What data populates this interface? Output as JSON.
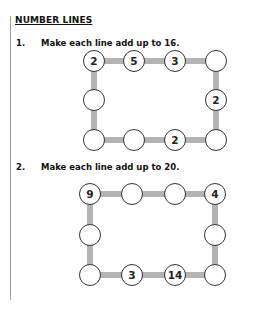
{
  "heading": "NUMBER LINES",
  "questions": [
    {
      "number": "1.",
      "text": "Make each line add up to 16.",
      "circles": {
        "top": [
          "2",
          "5",
          "3",
          ""
        ],
        "left_middle": "",
        "right_middle": "2",
        "bottom": [
          "",
          "",
          "2",
          ""
        ]
      }
    },
    {
      "number": "2.",
      "text": "Make each line add up to 20.",
      "circles": {
        "top": [
          "9",
          "",
          "",
          "4"
        ],
        "left_middle": "",
        "right_middle": "",
        "bottom": [
          "",
          "3",
          "14",
          ""
        ]
      }
    }
  ],
  "colors": {
    "connector": "#b3b3b3",
    "circle_border": "#333333",
    "rule": "#9a9a9a"
  }
}
